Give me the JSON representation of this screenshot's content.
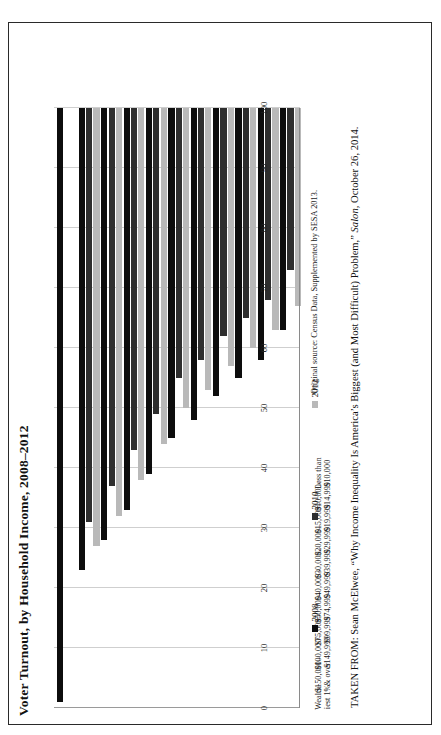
{
  "figure": {
    "title": "Voter Turnout, by Household Income, 2008–2012",
    "source_note": "Original source: Census Data, Supplemented by SESA 2013.",
    "attribution_line1": "TAKEN FROM: Sean McElwee, “Why Income Inequality Is America’s Biggest (and Most Difficult) Problem,” ",
    "attribution_italic": "Salon,",
    "attribution_line2": "October 26, 2014."
  },
  "legend": {
    "position": "below-plot",
    "entries": [
      {
        "label": "2008",
        "color": "#0d0d0d"
      },
      {
        "label": "2010",
        "color": "#2e2e2e"
      },
      {
        "label": "2012",
        "color": "#b9b9b9"
      }
    ]
  },
  "chart_data": {
    "type": "bar",
    "orientation": "horizontal",
    "title": "Voter Turnout, by Household Income, 2008–2012",
    "xlabel": "",
    "ylabel": "",
    "grid": true,
    "axis_range": [
      0,
      100
    ],
    "tick_labels": [
      "100",
      "90",
      "80",
      "70",
      "60",
      "50",
      "40",
      "30",
      "20",
      "10",
      "0"
    ],
    "categories": [
      "Less than $10,000",
      "$10,000–$14,999",
      "$15,000–$19,999",
      "$20,000–$29,999",
      "$30,000–$39,999",
      "$40,000–$49,999",
      "$50,000–$74,999",
      "$75,000–$99,999",
      "$100,000–$149,999",
      "$150,000 & over",
      "Wealthiest 1%"
    ],
    "category_lines": [
      [
        "Less than",
        "$10,000"
      ],
      [
        "$10,000–",
        "$14,999"
      ],
      [
        "$15,000–",
        "$19,999"
      ],
      [
        "$20,000–",
        "$29,999"
      ],
      [
        "$30,000–",
        "$39,999"
      ],
      [
        "$40,000–",
        "$49,999"
      ],
      [
        "$50,000–",
        "$74,999"
      ],
      [
        "$75,000–",
        "$99,999"
      ],
      [
        "$100,000–",
        "$149,999"
      ],
      [
        "$150,000–",
        "& over"
      ],
      [
        "Wealth-",
        "iest 1%"
      ]
    ],
    "series": [
      {
        "name": "2008",
        "color": "#0d0d0d",
        "values": [
          37,
          42,
          45,
          48,
          52,
          55,
          61,
          67,
          72,
          77,
          99
        ]
      },
      {
        "name": "2010",
        "color": "#2e2e2e",
        "values": [
          27,
          32,
          35,
          38,
          42,
          45,
          51,
          57,
          63,
          69,
          null
        ]
      },
      {
        "name": "2012",
        "color": "#b9b9b9",
        "values": [
          33,
          37,
          40,
          43,
          47,
          50,
          56,
          62,
          68,
          73,
          null
        ]
      }
    ]
  }
}
